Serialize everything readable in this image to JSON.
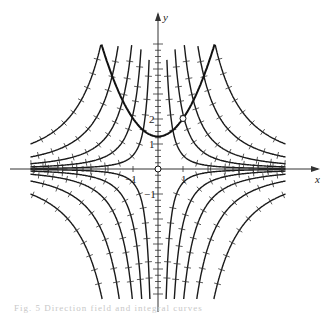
{
  "figure": {
    "caption": "Fig. 5  Direction field and integral curves"
  },
  "chart_data": {
    "type": "line",
    "title": "",
    "xlabel": "x",
    "ylabel": "y",
    "xlim": [
      -5.1,
      5.1
    ],
    "ylim": [
      -5.2,
      5.0
    ],
    "grid": false,
    "x_ticks": [
      {
        "value": -1,
        "label": "-1"
      },
      {
        "value": 1,
        "label": "1"
      }
    ],
    "y_ticks": [
      {
        "value": 1,
        "label": "1"
      },
      {
        "value": 2,
        "label": "2"
      },
      {
        "value": -1,
        "label": "-1"
      }
    ],
    "integral_curves": {
      "family": "y = C / x^2",
      "C_values_positive": [
        0.55,
        2.2,
        5.5,
        12.5,
        26
      ],
      "C_values_negative": [
        -0.55,
        -2.2,
        -5.5,
        -12.5,
        -26
      ]
    },
    "highlighted_curve": {
      "label": "parabola through (1, 2)",
      "equation": "y = 0.72 x^2 + 1.3",
      "vertex": [
        0,
        1.3
      ],
      "marked_point": [
        1,
        2.02
      ]
    },
    "open_points": [
      [
        0,
        0
      ],
      [
        1,
        2.02
      ]
    ]
  }
}
